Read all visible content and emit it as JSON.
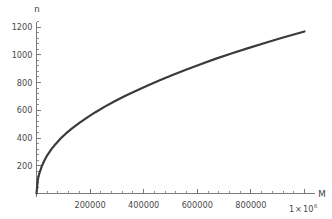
{
  "chart_data": {
    "type": "line",
    "title": "",
    "subtitle": "",
    "xlabel": "M",
    "ylabel": "n",
    "xlim": [
      0,
      1000000
    ],
    "ylim": [
      0,
      1260
    ],
    "grid": false,
    "legend": null,
    "x_tick_labels": [
      "200000",
      "400000",
      "600000",
      "800000"
    ],
    "x_tick_values": [
      200000,
      400000,
      600000,
      800000
    ],
    "x_end_label_mantissa": "1",
    "x_end_label_times": "×",
    "x_end_label_base": "10",
    "x_end_label_exponent": "6",
    "x_end_tick_value": 1000000,
    "x_minor_step": 40000,
    "y_tick_labels": [
      "200",
      "400",
      "600",
      "800",
      "1000",
      "1200"
    ],
    "y_tick_values": [
      200,
      400,
      600,
      800,
      1000,
      1200
    ],
    "y_minor_step": 40,
    "series": [
      {
        "name": "n(M)",
        "color": "#3a3a3a",
        "x": [
          0,
          5000,
          10000,
          20000,
          30000,
          40000,
          55000,
          70000,
          90000,
          110000,
          135000,
          160000,
          190000,
          220000,
          255000,
          290000,
          330000,
          370000,
          415000,
          460000,
          510000,
          560000,
          615000,
          670000,
          730000,
          790000,
          855000,
          920000,
          960000,
          1000000
        ],
        "y": [
          0,
          100,
          142,
          198,
          240,
          275,
          318,
          354,
          396,
          433,
          473,
          509,
          549,
          586,
          626,
          663,
          702,
          739,
          779,
          816,
          856,
          894,
          934,
          972,
          1011,
          1048,
          1087,
          1124,
          1146,
          1168
        ]
      }
    ],
    "axis_color": "#7a7a7a",
    "text_color": "#4a4a4a",
    "curve_color": "#3a3a3a",
    "background_color": "#ffffff"
  }
}
